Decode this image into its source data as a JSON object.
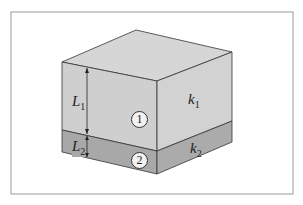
{
  "figure": {
    "layers": [
      {
        "id": "1",
        "thickness_label": "L",
        "thickness_sub": "1",
        "conductivity_label": "k",
        "conductivity_sub": "1",
        "color": "#cfcfcf"
      },
      {
        "id": "2",
        "thickness_label": "L",
        "thickness_sub": "2",
        "conductivity_label": "k",
        "conductivity_sub": "2",
        "color": "#a8a8a8"
      }
    ],
    "colors": {
      "frame": "#9a9a9a",
      "edges": "#333333",
      "top_face": "#d6d6d6",
      "layer1_front": "#cfcfcf",
      "layer1_side": "#d2d2d2",
      "layer2": "#a8a8a8"
    }
  }
}
